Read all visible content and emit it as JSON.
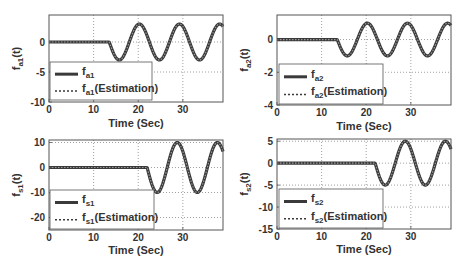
{
  "chart_data": [
    {
      "type": "line",
      "title": "",
      "xlabel": "Time (Sec)",
      "ylabel": "f_a1(t)",
      "xlim": [
        0,
        39
      ],
      "ylim": [
        -10,
        4.5
      ],
      "xticks": [
        0,
        10,
        20,
        30
      ],
      "yticks": [
        0,
        -5,
        -10
      ],
      "grid": true,
      "legend_position": "lower left",
      "x": [
        0,
        1,
        2,
        3,
        4,
        5,
        6,
        7,
        8,
        9,
        10,
        11,
        12,
        13,
        13.5,
        14,
        15,
        16,
        17,
        18,
        19,
        20,
        21,
        22,
        23,
        24,
        25,
        26,
        27,
        28,
        29,
        30,
        31,
        32,
        33,
        34,
        35,
        36,
        37,
        38,
        39
      ],
      "series": [
        {
          "name": "f_a1",
          "style": "solid",
          "values": [
            0,
            0,
            0,
            0,
            0,
            0,
            0,
            0,
            0,
            0,
            0,
            0,
            0,
            0,
            0,
            -1.03,
            -2.6,
            -2.95,
            -1.93,
            0,
            1.93,
            2.95,
            2.6,
            1.03,
            -1.03,
            -2.6,
            -2.95,
            -1.93,
            0,
            1.93,
            2.95,
            2.6,
            1.03,
            -1.03,
            -2.6,
            -2.95,
            -1.93,
            0,
            1.93,
            2.95,
            2.6
          ]
        },
        {
          "name": "f_a1(Estimation)",
          "style": "dotted",
          "values": [
            0,
            0,
            0,
            0,
            0,
            0,
            0,
            0,
            0,
            0,
            0,
            0,
            0,
            0,
            0,
            -1.03,
            -2.6,
            -2.95,
            -1.93,
            0,
            1.93,
            2.95,
            2.6,
            1.03,
            -1.03,
            -2.6,
            -2.95,
            -1.93,
            0,
            1.93,
            2.95,
            2.6,
            1.03,
            -1.03,
            -2.6,
            -2.95,
            -1.93,
            0,
            1.93,
            2.95,
            2.6
          ]
        }
      ]
    },
    {
      "type": "line",
      "title": "",
      "xlabel": "Time (Sec)",
      "ylabel": "f_a2(t)",
      "xlim": [
        0,
        39
      ],
      "ylim": [
        -4,
        1.5
      ],
      "xticks": [
        0,
        10,
        20,
        30
      ],
      "yticks": [
        0,
        -2,
        -4
      ],
      "grid": true,
      "legend_position": "lower left",
      "x": [
        0,
        1,
        2,
        3,
        4,
        5,
        6,
        7,
        8,
        9,
        10,
        11,
        12,
        13,
        13.5,
        14,
        15,
        16,
        17,
        18,
        19,
        20,
        21,
        22,
        23,
        24,
        25,
        26,
        27,
        28,
        29,
        30,
        31,
        32,
        33,
        34,
        35,
        36,
        37,
        38,
        39
      ],
      "series": [
        {
          "name": "f_a2",
          "style": "solid",
          "values": [
            0,
            0,
            0,
            0,
            0,
            0,
            0,
            0,
            0,
            0,
            0,
            0,
            0,
            0,
            0,
            -0.34,
            -0.87,
            -0.98,
            -0.64,
            0,
            0.64,
            0.98,
            0.87,
            0.34,
            -0.34,
            -0.87,
            -0.98,
            -0.64,
            0,
            0.64,
            0.98,
            0.87,
            0.34,
            -0.34,
            -0.87,
            -0.98,
            -0.64,
            0,
            0.64,
            0.98,
            0.87
          ]
        },
        {
          "name": "f_a2(Estimation)",
          "style": "dotted",
          "values": [
            0,
            0,
            0,
            0,
            0,
            0,
            0,
            0,
            0,
            0,
            0,
            0,
            0,
            0,
            0,
            -0.34,
            -0.87,
            -0.98,
            -0.64,
            0,
            0.64,
            0.98,
            0.87,
            0.34,
            -0.34,
            -0.87,
            -0.98,
            -0.64,
            0,
            0.64,
            0.98,
            0.87,
            0.34,
            -0.34,
            -0.87,
            -0.98,
            -0.64,
            0,
            0.64,
            0.98,
            0.87
          ]
        }
      ]
    },
    {
      "type": "line",
      "title": "",
      "xlabel": "Time (Sec)",
      "ylabel": "f_s1(t)",
      "xlim": [
        0,
        39
      ],
      "ylim": [
        -25,
        11
      ],
      "xticks": [
        0,
        10,
        20,
        30
      ],
      "yticks": [
        10,
        0,
        -10,
        -20
      ],
      "grid": true,
      "legend_position": "lower left",
      "x": [
        0,
        1,
        2,
        3,
        4,
        5,
        6,
        7,
        8,
        9,
        10,
        11,
        12,
        13,
        14,
        15,
        16,
        17,
        18,
        19,
        20,
        21,
        22,
        23,
        24,
        25,
        26,
        27,
        28,
        29,
        30,
        31,
        32,
        33,
        34,
        35,
        36,
        37,
        38,
        39
      ],
      "series": [
        {
          "name": "f_s1",
          "style": "solid",
          "values": [
            0,
            0,
            0,
            0,
            0,
            0,
            0,
            0,
            0,
            0,
            0,
            0,
            0,
            0,
            0,
            0,
            0,
            0,
            0,
            0,
            0,
            0,
            0,
            -6.43,
            -9.85,
            -8.66,
            -3.42,
            3.42,
            8.66,
            9.85,
            6.43,
            0,
            -6.43,
            -9.85,
            -8.66,
            -3.42,
            3.42,
            8.66,
            9.85,
            6.43
          ]
        },
        {
          "name": "f_s1(Estimation)",
          "style": "dotted",
          "values": [
            0,
            0,
            0,
            0,
            0,
            0,
            0,
            0,
            0,
            0,
            0,
            0,
            0,
            0,
            0,
            0,
            0,
            0,
            0,
            0,
            0,
            0,
            0,
            -6.43,
            -9.85,
            -8.66,
            -3.42,
            3.42,
            8.66,
            9.85,
            6.43,
            0,
            -6.43,
            -9.85,
            -8.66,
            -3.42,
            3.42,
            8.66,
            9.85,
            6.43
          ]
        }
      ]
    },
    {
      "type": "line",
      "title": "",
      "xlabel": "Time (Sec)",
      "ylabel": "f_s2(t)",
      "xlim": [
        0,
        39
      ],
      "ylim": [
        -15,
        5.5
      ],
      "xticks": [
        0,
        10,
        20,
        30
      ],
      "yticks": [
        5,
        0,
        -5,
        -10,
        -15
      ],
      "grid": true,
      "legend_position": "lower left",
      "x": [
        0,
        1,
        2,
        3,
        4,
        5,
        6,
        7,
        8,
        9,
        10,
        11,
        12,
        13,
        14,
        15,
        16,
        17,
        18,
        19,
        20,
        21,
        22,
        23,
        24,
        25,
        26,
        27,
        28,
        29,
        30,
        31,
        32,
        33,
        34,
        35,
        36,
        37,
        38,
        39
      ],
      "series": [
        {
          "name": "f_s2",
          "style": "solid",
          "values": [
            0,
            0,
            0,
            0,
            0,
            0,
            0,
            0,
            0,
            0,
            0,
            0,
            0,
            0,
            0,
            0,
            0,
            0,
            0,
            0,
            0,
            0,
            0,
            -3.21,
            -4.92,
            -4.33,
            -1.71,
            1.71,
            4.33,
            4.92,
            3.21,
            0,
            -3.21,
            -4.92,
            -4.33,
            -1.71,
            1.71,
            4.33,
            4.92,
            3.21
          ]
        },
        {
          "name": "f_s2(Estimation)",
          "style": "dotted",
          "values": [
            0,
            0,
            0,
            0,
            0,
            0,
            0,
            0,
            0,
            0,
            0,
            0,
            0,
            0,
            0,
            0,
            0,
            0,
            0,
            0,
            0,
            0,
            0,
            -3.21,
            -4.92,
            -4.33,
            -1.71,
            1.71,
            4.33,
            4.92,
            3.21,
            0,
            -3.21,
            -4.92,
            -4.33,
            -1.71,
            1.71,
            4.33,
            4.92,
            3.21
          ]
        }
      ]
    }
  ],
  "signal_model": [
    {
      "amplitude": 3,
      "onset": 13.5,
      "period": 9
    },
    {
      "amplitude": 1,
      "onset": 13.5,
      "period": 9
    },
    {
      "amplitude": 10,
      "onset": 22,
      "period": 9
    },
    {
      "amplitude": 5,
      "onset": 22,
      "period": 9
    }
  ],
  "panels": [
    {
      "ylabel_main": "f",
      "ylabel_sub": "a1",
      "ylabel_tail": "(t)",
      "legend": [
        {
          "main": "f",
          "sub": "a1",
          "tail": ""
        },
        {
          "main": "f",
          "sub": "a1",
          "tail": "(Estimation)"
        }
      ],
      "xlabel": "Time (Sec)",
      "xtick_labels": [
        "0",
        "10",
        "20",
        "30"
      ],
      "ytick_labels": [
        "0",
        "-5",
        "-10"
      ]
    },
    {
      "ylabel_main": "f",
      "ylabel_sub": "a2",
      "ylabel_tail": "(t)",
      "legend": [
        {
          "main": "f",
          "sub": "a2",
          "tail": ""
        },
        {
          "main": "f",
          "sub": "a2",
          "tail": "(Estimation)"
        }
      ],
      "xlabel": "Time (Sec)",
      "xtick_labels": [
        "0",
        "10",
        "20",
        "30"
      ],
      "ytick_labels": [
        "0",
        "-2",
        "-4"
      ]
    },
    {
      "ylabel_main": "f",
      "ylabel_sub": "s1",
      "ylabel_tail": "(t)",
      "legend": [
        {
          "main": "f",
          "sub": "s1",
          "tail": ""
        },
        {
          "main": "f",
          "sub": "s1",
          "tail": "(Estimation)"
        }
      ],
      "xlabel": "Time (Sec)",
      "xtick_labels": [
        "0",
        "10",
        "20",
        "30"
      ],
      "ytick_labels": [
        "10",
        "0",
        "-10",
        "-20"
      ]
    },
    {
      "ylabel_main": "f",
      "ylabel_sub": "s2",
      "ylabel_tail": "(t)",
      "legend": [
        {
          "main": "f",
          "sub": "s2",
          "tail": ""
        },
        {
          "main": "f",
          "sub": "s2",
          "tail": "(Estimation)"
        }
      ],
      "xlabel": "Time (Sec)",
      "xtick_labels": [
        "0",
        "10",
        "20",
        "30"
      ],
      "ytick_labels": [
        "5",
        "0",
        "-5",
        "-10",
        "-15"
      ]
    }
  ],
  "colors": {
    "actual_line": "#3a3a3a",
    "estimate_line": "#9a9a9a",
    "axes": "#555555",
    "grid": "#777777",
    "text": "#333333"
  }
}
